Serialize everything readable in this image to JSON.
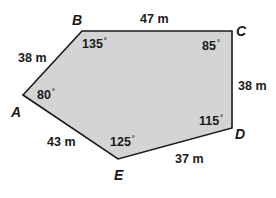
{
  "figure": {
    "type": "pentagon",
    "fill_color": "#d4d4d4",
    "stroke_color": "#1a1a1a",
    "vertices": [
      {
        "name": "A",
        "x": 23,
        "y": 95
      },
      {
        "name": "B",
        "x": 82,
        "y": 31
      },
      {
        "name": "C",
        "x": 232,
        "y": 31
      },
      {
        "name": "D",
        "x": 232,
        "y": 128
      },
      {
        "name": "E",
        "x": 118,
        "y": 159
      }
    ]
  },
  "labels": {
    "vertices": {
      "A": "A",
      "B": "B",
      "C": "C",
      "D": "D",
      "E": "E"
    },
    "sides": {
      "AB": "38 m",
      "BC": "47 m",
      "CD": "38 m",
      "DE": "37 m",
      "EA": "43 m"
    },
    "angles": {
      "A": "80",
      "B": "135",
      "C": "85",
      "D": "115",
      "E": "125"
    },
    "degree_symbol": "°"
  }
}
